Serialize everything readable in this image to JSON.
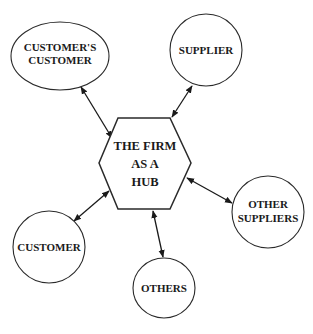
{
  "diagram": {
    "type": "hub-and-spoke",
    "hub": {
      "id": "firm",
      "shape": "hexagon",
      "lines": [
        "THE FIRM",
        "AS A",
        "HUB"
      ]
    },
    "nodes": [
      {
        "id": "customers_customer",
        "shape": "ellipse",
        "lines": [
          "CUSTOMER'S",
          "CUSTOMER"
        ]
      },
      {
        "id": "supplier",
        "shape": "circle",
        "lines": [
          "SUPPLIER"
        ]
      },
      {
        "id": "other_suppliers",
        "shape": "circle",
        "lines": [
          "OTHER",
          "SUPPLIERS"
        ]
      },
      {
        "id": "others",
        "shape": "ellipse",
        "lines": [
          "OTHERS"
        ]
      },
      {
        "id": "customer",
        "shape": "circle",
        "lines": [
          "CUSTOMER"
        ]
      }
    ],
    "edges": [
      {
        "from": "firm",
        "to": "customers_customer",
        "direction": "bidirectional"
      },
      {
        "from": "firm",
        "to": "supplier",
        "direction": "bidirectional"
      },
      {
        "from": "firm",
        "to": "other_suppliers",
        "direction": "bidirectional"
      },
      {
        "from": "firm",
        "to": "others",
        "direction": "bidirectional"
      },
      {
        "from": "firm",
        "to": "customer",
        "direction": "bidirectional"
      }
    ],
    "colors": {
      "stroke": "#2a2a2a",
      "text": "#1a1a1a",
      "background": "#ffffff"
    }
  }
}
